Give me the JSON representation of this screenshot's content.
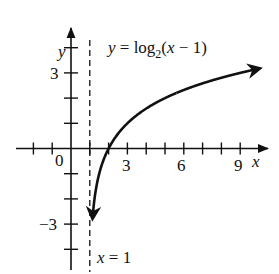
{
  "chart_data": {
    "type": "line",
    "title": "",
    "function_label": "y = log2(x − 1)",
    "function_label_parts": {
      "lhs": "y = log",
      "sub": "2",
      "rhs": "(x − 1)"
    },
    "asymptote_label": "x = 1",
    "xlabel": "x",
    "ylabel": "y",
    "origin_label": "0",
    "x_tick_labels": [
      "3",
      "6",
      "9"
    ],
    "y_tick_labels": [
      "3",
      "−3"
    ],
    "xlim": [
      -3,
      10
    ],
    "ylim": [
      -4,
      4.5
    ],
    "x_ticks": [
      -2,
      -1,
      1,
      2,
      3,
      4,
      5,
      6,
      7,
      8,
      9
    ],
    "y_ticks": [
      -4,
      -3,
      -2,
      -1,
      1,
      2,
      3,
      4
    ],
    "asymptote": {
      "x": 1,
      "style": "dashed"
    },
    "series": [
      {
        "name": "y = log2(x − 1)",
        "x": [
          1.125,
          1.25,
          1.5,
          2,
          3,
          4,
          5,
          6,
          7,
          8,
          9,
          10
        ],
        "y": [
          -3,
          -2,
          -1,
          0,
          1,
          1.585,
          2,
          2.322,
          2.585,
          2.807,
          3,
          3.17
        ]
      }
    ],
    "grid": false,
    "legend": "none"
  },
  "colors": {
    "ink": "#111111",
    "background": "#ffffff"
  }
}
